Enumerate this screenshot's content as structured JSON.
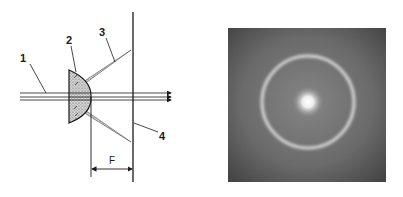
{
  "figure": {
    "left_panel": {
      "type": "optical-schematic",
      "labels": {
        "beam": "1",
        "lens": "2",
        "cone": "3",
        "screen": "4",
        "focal_distance": "F"
      }
    },
    "right_panel": {
      "type": "photograph",
      "subject": "bright central spot surrounded by a concentric light ring on grey background"
    }
  },
  "colors": {
    "ink": "#1a1a1a",
    "cone_fill": "#b8b8b8",
    "photo_bg_edge": "#4a4a4a",
    "photo_bg_center": "#7a7a7a",
    "ring": "#d8d8d8",
    "spot": "#f4f4f4"
  }
}
